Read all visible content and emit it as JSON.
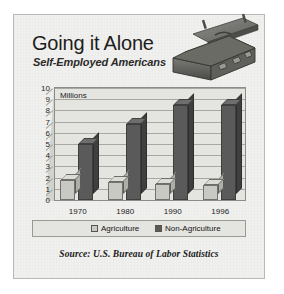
{
  "header": {
    "title": "Going it Alone",
    "subtitle": "Self-Employed Americans",
    "artwork": "open-briefcase-illustration"
  },
  "source": {
    "text": "Source:  U.S. Bureau of Labor Statistics"
  },
  "colors": {
    "panel_background": "#f0f0ee",
    "plot_background": "#e4e4e0",
    "gridline": "#a8a8a2",
    "agriculture": "#c9c9c4",
    "agriculture_side": "#aeaea8",
    "agriculture_top": "#dcdcd7",
    "non_agriculture": "#5a5a5a",
    "non_agriculture_side": "#3f3f3f",
    "non_agriculture_top": "#6e6e6e",
    "text": "#1b1b1b",
    "border": "#8d8d88"
  },
  "chart_data": {
    "type": "bar",
    "title": "Going it Alone",
    "subtitle": "Self-Employed Americans",
    "xlabel": "",
    "ylabel": "Millions",
    "unit_label": "Millions",
    "categories": [
      "1970",
      "1980",
      "1990",
      "1996"
    ],
    "ylim": [
      0,
      10
    ],
    "yticks": [
      0,
      1,
      2,
      3,
      4,
      5,
      6,
      7,
      8,
      9,
      10
    ],
    "grid": true,
    "legend_position": "bottom",
    "style": "3d-column",
    "series": [
      {
        "name": "Agriculture",
        "color": "#c9c9c4",
        "values": [
          1.8,
          1.6,
          1.4,
          1.3
        ]
      },
      {
        "name": "Non-Agriculture",
        "color": "#5a5a5a",
        "values": [
          5.0,
          6.8,
          8.5,
          8.5
        ]
      }
    ],
    "annotations": [
      {
        "text": "Millions",
        "position": "top-left-inside-plot"
      }
    ]
  }
}
